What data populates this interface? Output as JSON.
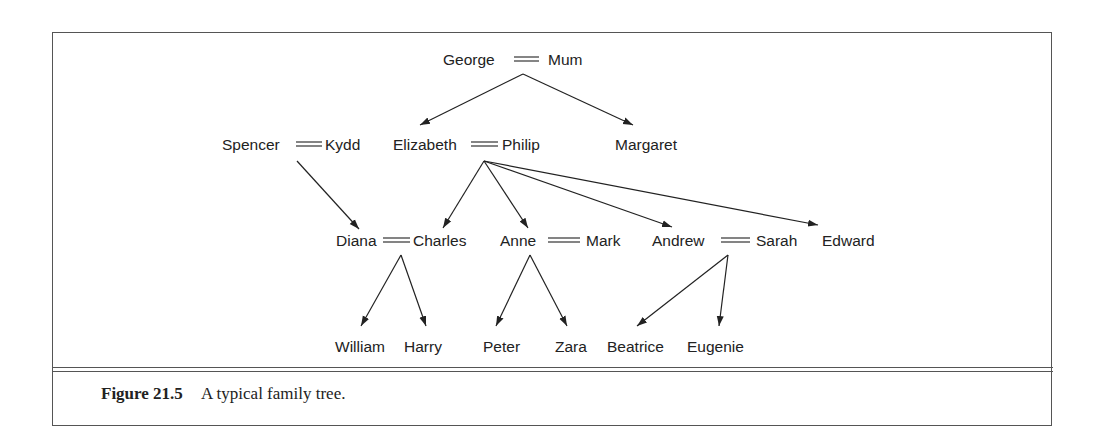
{
  "figure": {
    "label": "Figure 21.5",
    "caption": "A typical family tree."
  },
  "people": {
    "george": "George",
    "mum": "Mum",
    "spencer": "Spencer",
    "kydd": "Kydd",
    "elizabeth": "Elizabeth",
    "philip": "Philip",
    "margaret": "Margaret",
    "diana": "Diana",
    "charles": "Charles",
    "anne": "Anne",
    "mark": "Mark",
    "andrew": "Andrew",
    "sarah": "Sarah",
    "edward": "Edward",
    "william": "William",
    "harry": "Harry",
    "peter": "Peter",
    "zara": "Zara",
    "beatrice": "Beatrice",
    "eugenie": "Eugenie"
  },
  "marriages": [
    [
      "George",
      "Mum"
    ],
    [
      "Spencer",
      "Kydd"
    ],
    [
      "Elizabeth",
      "Philip"
    ],
    [
      "Diana",
      "Charles"
    ],
    [
      "Anne",
      "Mark"
    ],
    [
      "Andrew",
      "Sarah"
    ]
  ],
  "parent_of": [
    {
      "parents": [
        "George",
        "Mum"
      ],
      "children": [
        "Elizabeth",
        "Margaret"
      ]
    },
    {
      "parents": [
        "Spencer",
        "Kydd"
      ],
      "children": [
        "Diana"
      ]
    },
    {
      "parents": [
        "Elizabeth",
        "Philip"
      ],
      "children": [
        "Charles",
        "Anne",
        "Andrew",
        "Edward"
      ]
    },
    {
      "parents": [
        "Diana",
        "Charles"
      ],
      "children": [
        "William",
        "Harry"
      ]
    },
    {
      "parents": [
        "Anne",
        "Mark"
      ],
      "children": [
        "Peter",
        "Zara"
      ]
    },
    {
      "parents": [
        "Andrew",
        "Sarah"
      ],
      "children": [
        "Beatrice",
        "Eugenie"
      ]
    }
  ]
}
